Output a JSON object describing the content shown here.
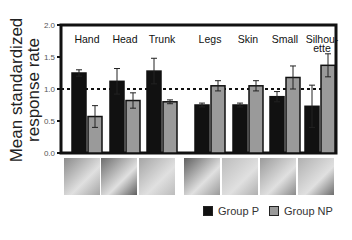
{
  "chart_data": {
    "type": "bar",
    "title": "",
    "xlabel": "",
    "ylabel": "Mean standardized response rate",
    "ylim": [
      0,
      2.0
    ],
    "yticks": [
      0.0,
      0.5,
      1.0,
      1.5,
      2.0
    ],
    "ytick_labels": [
      "0.0",
      "0.5",
      "1.0",
      "1.5",
      "2.0"
    ],
    "reference_line": {
      "y": 1.0,
      "style": "dotted"
    },
    "categories": [
      "Hand",
      "Head",
      "Trunk",
      "Legs",
      "Skin",
      "Small",
      "Silhou-ette"
    ],
    "series": [
      {
        "name": "Group P",
        "color": "#111111",
        "values": [
          1.25,
          1.12,
          1.28,
          0.75,
          0.75,
          0.88,
          0.73
        ],
        "errors": [
          0.05,
          0.2,
          0.2,
          0.03,
          0.03,
          0.08,
          0.33
        ]
      },
      {
        "name": "Group NP",
        "color": "#9a9a9a",
        "values": [
          0.57,
          0.82,
          0.8,
          1.05,
          1.05,
          1.18,
          1.37
        ],
        "errors": [
          0.17,
          0.12,
          0.03,
          0.08,
          0.08,
          0.18,
          0.18
        ]
      }
    ],
    "legend_position": "bottom-right",
    "grid": false
  },
  "axis": {
    "ylabel_line1": "Mean standardized",
    "ylabel_line2": "response rate"
  },
  "legend": {
    "items": [
      {
        "label": "Group P",
        "color": "#111111"
      },
      {
        "label": "Group NP",
        "color": "#9a9a9a"
      }
    ]
  },
  "thumbnails": [
    {
      "category": "Hand",
      "description": "hand writing"
    },
    {
      "category": "Head",
      "description": "smiling face"
    },
    {
      "category": "Trunk",
      "description": "torso figure"
    },
    {
      "category": "Legs",
      "description": "legs close-up"
    },
    {
      "category": "Skin",
      "description": "skin texture"
    },
    {
      "category": "Small",
      "description": "small figure in landscape"
    },
    {
      "category": "Silhou-ette",
      "description": "silhouette figure"
    }
  ]
}
